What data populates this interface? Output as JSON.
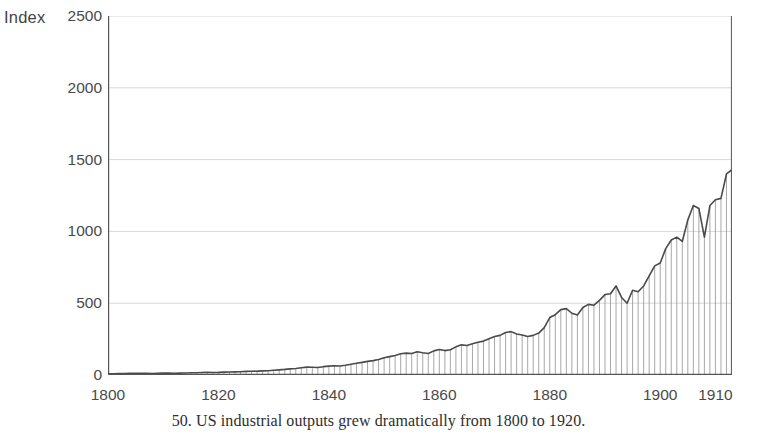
{
  "figure": {
    "caption": "50. US industrial outputs grew dramatically from 1800 to 1920.",
    "y_axis_title": "Index"
  },
  "colors": {
    "line": "#4a4a4a",
    "stem": "#8a8a8a",
    "axis": "#555555",
    "grid": "#d8d8d8",
    "text": "#4a4a4a",
    "background": "#ffffff"
  },
  "chart_data": {
    "type": "line",
    "title": "",
    "subtitle": "",
    "xlabel": "",
    "ylabel": "Index",
    "xlim": [
      1800,
      1913
    ],
    "ylim": [
      0,
      2500
    ],
    "grid": true,
    "legend": null,
    "style": "stem-with-connecting-line",
    "yticks": [
      0,
      500,
      1000,
      1500,
      2000,
      2500
    ],
    "ytick_labels": [
      "0",
      "500",
      "1000",
      "1500",
      "2000",
      "2500"
    ],
    "xticks": [
      1800,
      1820,
      1840,
      1860,
      1880,
      1900,
      1910
    ],
    "xtick_labels": [
      "1800",
      "1820",
      "1840",
      "1860",
      "1880",
      "1900",
      "1910"
    ],
    "x": [
      1800,
      1801,
      1802,
      1803,
      1804,
      1805,
      1806,
      1807,
      1808,
      1809,
      1810,
      1811,
      1812,
      1813,
      1814,
      1815,
      1816,
      1817,
      1818,
      1819,
      1820,
      1821,
      1822,
      1823,
      1824,
      1825,
      1826,
      1827,
      1828,
      1829,
      1830,
      1831,
      1832,
      1833,
      1834,
      1835,
      1836,
      1837,
      1838,
      1839,
      1840,
      1841,
      1842,
      1843,
      1844,
      1845,
      1846,
      1847,
      1848,
      1849,
      1850,
      1851,
      1852,
      1853,
      1854,
      1855,
      1856,
      1857,
      1858,
      1859,
      1860,
      1861,
      1862,
      1863,
      1864,
      1865,
      1866,
      1867,
      1868,
      1869,
      1870,
      1871,
      1872,
      1873,
      1874,
      1875,
      1876,
      1877,
      1878,
      1879,
      1880,
      1881,
      1882,
      1883,
      1884,
      1885,
      1886,
      1887,
      1888,
      1889,
      1890,
      1891,
      1892,
      1893,
      1894,
      1895,
      1896,
      1897,
      1898,
      1899,
      1900,
      1901,
      1902,
      1903,
      1904,
      1905,
      1906,
      1907,
      1908,
      1909,
      1910,
      1911,
      1912,
      1913
    ],
    "values": [
      8,
      9,
      10,
      10,
      11,
      12,
      12,
      11,
      10,
      12,
      13,
      13,
      12,
      13,
      14,
      16,
      16,
      17,
      18,
      17,
      18,
      20,
      21,
      22,
      23,
      25,
      26,
      27,
      29,
      30,
      33,
      36,
      39,
      43,
      45,
      50,
      55,
      54,
      52,
      58,
      62,
      64,
      63,
      68,
      75,
      82,
      88,
      95,
      100,
      108,
      120,
      128,
      136,
      148,
      152,
      150,
      162,
      155,
      150,
      168,
      178,
      170,
      176,
      196,
      210,
      205,
      218,
      228,
      236,
      252,
      268,
      276,
      296,
      302,
      286,
      278,
      268,
      276,
      292,
      330,
      400,
      420,
      455,
      462,
      430,
      418,
      470,
      492,
      486,
      520,
      560,
      566,
      620,
      540,
      500,
      590,
      580,
      620,
      690,
      760,
      780,
      880,
      940,
      960,
      930,
      1080,
      1180,
      1160,
      960,
      1180,
      1220,
      1230,
      1400,
      1430
    ],
    "annotations": []
  }
}
